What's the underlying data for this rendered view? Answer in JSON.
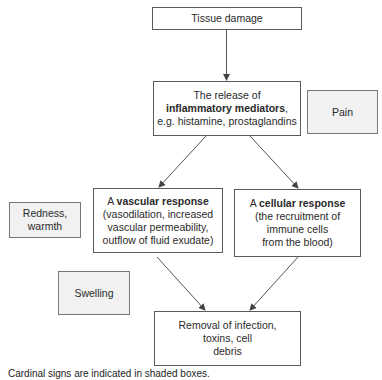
{
  "diagram": {
    "colors": {
      "border": "#5a5a5a",
      "shaded_fill": "#f1f1f1",
      "arrow": "#555555"
    },
    "nodes": {
      "tissue_damage": {
        "text": "Tissue damage"
      },
      "mediators": {
        "line1": "The release of",
        "line2_bold": "inflammatory mediators",
        "line2_suffix": ",",
        "line3": "e.g. histamine, prostaglandins"
      },
      "vascular": {
        "prefix": "A ",
        "bold": "vascular response",
        "line2": "(vasodilation, increased",
        "line3": "vascular permeability,",
        "line4": "outflow of fluid exudate)"
      },
      "cellular": {
        "prefix": "A ",
        "bold": "cellular response",
        "line2": "(the recruitment of",
        "line3": "immune cells",
        "line4": "from the blood)"
      },
      "removal": {
        "line1": "Removal of infection,",
        "line2": "toxins, cell",
        "line3": "debris"
      }
    },
    "cardinal_signs": {
      "pain": {
        "text": "Pain"
      },
      "redness": {
        "line1": "Redness,",
        "line2": "warmth"
      },
      "swelling": {
        "text": "Swelling"
      }
    },
    "edges": [
      {
        "from": "tissue_damage",
        "to": "mediators"
      },
      {
        "from": "mediators",
        "to": "vascular"
      },
      {
        "from": "mediators",
        "to": "cellular"
      },
      {
        "from": "vascular",
        "to": "removal"
      },
      {
        "from": "cellular",
        "to": "removal"
      }
    ],
    "caption": "Cardinal signs are indicated in shaded boxes."
  }
}
